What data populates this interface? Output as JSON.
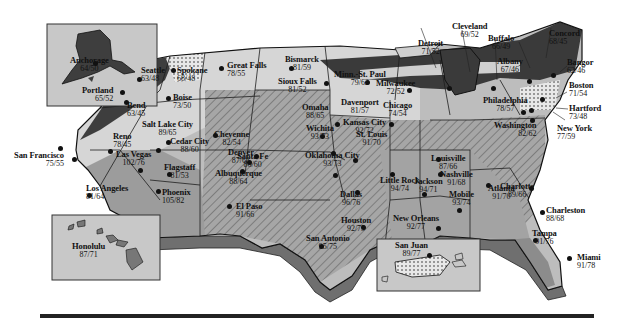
{
  "map": {
    "type": "weather-temperature-map",
    "region": "United States",
    "format": "high/low",
    "colors": {
      "coolest": "#3f3f3f",
      "cool": "#d8d8d8",
      "mild": "#c4c4c4",
      "warm": "#a9a9a9",
      "hot": "#8f8f8f",
      "inset_bg": "#c8c8c8",
      "border": "#1a1a1a"
    }
  },
  "cities": [
    {
      "name": "Anchorage",
      "temp": "64/50"
    },
    {
      "name": "Seattle",
      "temp": "63/48"
    },
    {
      "name": "Spokane",
      "temp": "68/48"
    },
    {
      "name": "Portland",
      "temp": "65/52"
    },
    {
      "name": "Bend",
      "temp": "63/45"
    },
    {
      "name": "Boise",
      "temp": "73/50"
    },
    {
      "name": "Great Falls",
      "temp": "78/55"
    },
    {
      "name": "Bismarck",
      "temp": "81/59"
    },
    {
      "name": "Sioux Falls",
      "temp": "81/52"
    },
    {
      "name": "Minn.-St. Paul",
      "temp": "79/62"
    },
    {
      "name": "Milwaukee",
      "temp": "72/52"
    },
    {
      "name": "Detroit",
      "temp": "71/52"
    },
    {
      "name": "Cleveland",
      "temp": "69/52"
    },
    {
      "name": "Buffalo",
      "temp": "66/49"
    },
    {
      "name": "Albany",
      "temp": "67/46"
    },
    {
      "name": "Concord",
      "temp": "68/45"
    },
    {
      "name": "Bangor",
      "temp": "62/46"
    },
    {
      "name": "Boston",
      "temp": "71/54"
    },
    {
      "name": "Hartford",
      "temp": "73/48"
    },
    {
      "name": "New York",
      "temp": "77/59"
    },
    {
      "name": "Philadelphia",
      "temp": "78/57"
    },
    {
      "name": "Washington",
      "temp": "82/62"
    },
    {
      "name": "Reno",
      "temp": "78/45"
    },
    {
      "name": "San Francisco",
      "temp": "75/55"
    },
    {
      "name": "Salt Lake City",
      "temp": "89/65"
    },
    {
      "name": "Cedar City",
      "temp": "88/60"
    },
    {
      "name": "Las Vegas",
      "temp": "102/76"
    },
    {
      "name": "Flagstaff",
      "temp": "81/53"
    },
    {
      "name": "Los Angeles",
      "temp": "81/64"
    },
    {
      "name": "Phoenix",
      "temp": "105/82"
    },
    {
      "name": "Cheyenne",
      "temp": "82/54"
    },
    {
      "name": "Denver",
      "temp": "87/61"
    },
    {
      "name": "Santa Fe",
      "temp": "86/60"
    },
    {
      "name": "Albuquerque",
      "temp": "88/64"
    },
    {
      "name": "El Paso",
      "temp": "91/66"
    },
    {
      "name": "Omaha",
      "temp": "88/65"
    },
    {
      "name": "Davenport",
      "temp": "81/57"
    },
    {
      "name": "Chicago",
      "temp": "74/54"
    },
    {
      "name": "Wichita",
      "temp": "93/73"
    },
    {
      "name": "Kansas City",
      "temp": "92/72"
    },
    {
      "name": "St. Louis",
      "temp": "91/70"
    },
    {
      "name": "Oklahoma City",
      "temp": "93/73"
    },
    {
      "name": "Louisville",
      "temp": "87/66"
    },
    {
      "name": "Nashville",
      "temp": "91/68"
    },
    {
      "name": "Charlotte",
      "temp": "89/66"
    },
    {
      "name": "Little Rock",
      "temp": "94/74"
    },
    {
      "name": "Jackson",
      "temp": "94/71"
    },
    {
      "name": "Atlanta",
      "temp": "91/70"
    },
    {
      "name": "Mobile",
      "temp": "93/74"
    },
    {
      "name": "Charleston",
      "temp": "88/68"
    },
    {
      "name": "Dallas",
      "temp": "96/76"
    },
    {
      "name": "Houston",
      "temp": "92/75"
    },
    {
      "name": "San Antonio",
      "temp": "95/75"
    },
    {
      "name": "New Orleans",
      "temp": "92/77"
    },
    {
      "name": "Tampa",
      "temp": "91/76"
    },
    {
      "name": "Miami",
      "temp": "91/78"
    },
    {
      "name": "Honolulu",
      "temp": "87/71"
    },
    {
      "name": "San Juan",
      "temp": "89/77"
    }
  ]
}
